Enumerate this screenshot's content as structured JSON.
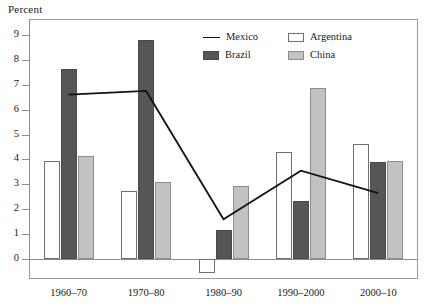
{
  "chart_data": {
    "type": "bar",
    "title": "",
    "ylabel": "Percent",
    "xlabel": "",
    "categories": [
      "1960–70",
      "1970–80",
      "1980–90",
      "1990–2000",
      "2000–10"
    ],
    "ylim": [
      -1,
      9.6
    ],
    "yticks": [
      0,
      1,
      2,
      3,
      4,
      5,
      6,
      7,
      8,
      9
    ],
    "ytick_labels": [
      "0",
      "1",
      "2",
      "3",
      "4",
      "5",
      "6",
      "7",
      "8",
      "9"
    ],
    "grid": false,
    "legend_position": "top-center-inside",
    "series": [
      {
        "name": "Mexico",
        "type": "line",
        "values": [
          6.6,
          6.75,
          1.6,
          3.55,
          2.65
        ],
        "color": "#111111"
      },
      {
        "name": "Argentina",
        "type": "bar",
        "values": [
          3.95,
          2.75,
          -0.55,
          4.3,
          4.6
        ],
        "color": "#ffffff"
      },
      {
        "name": "Brazil",
        "type": "bar",
        "values": [
          7.65,
          8.8,
          1.15,
          2.35,
          3.9
        ],
        "color": "#565656"
      },
      {
        "name": "China",
        "type": "bar",
        "values": [
          4.15,
          3.1,
          2.95,
          6.85,
          3.95
        ],
        "color": "#c2c2c2"
      }
    ]
  },
  "legend": {
    "entries": [
      {
        "label": "Mexico",
        "marker": "line-swatch"
      },
      {
        "label": "Argentina",
        "marker": "box-swatch-white"
      },
      {
        "label": "Brazil",
        "marker": "box-swatch-dark"
      },
      {
        "label": "China",
        "marker": "box-swatch-light"
      }
    ]
  },
  "colors": {
    "mexico_line": "#111111",
    "argentina_fill": "#ffffff",
    "brazil_fill": "#565656",
    "china_fill": "#c2c2c2",
    "axis": "#8d8d8d",
    "text": "#1a1a1a"
  }
}
